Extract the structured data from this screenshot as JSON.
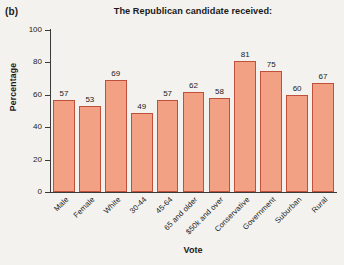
{
  "panel": {
    "label": "(b)"
  },
  "chart_data": {
    "type": "bar",
    "title": "The Republican candidate received:",
    "xlabel": "Vote",
    "ylabel": "Percentage",
    "ylim": [
      0,
      100
    ],
    "yticks": [
      0,
      20,
      40,
      60,
      80,
      100
    ],
    "grid": false,
    "legend": null,
    "bar_color": "#f2a184",
    "bar_edge_color": "#c0503a",
    "categories": [
      "Male",
      "Female",
      "White",
      "30-44",
      "45-64",
      "65 and older",
      "$50k and over",
      "Conservative",
      "Government",
      "Suburban",
      "Rural"
    ],
    "values": [
      57,
      53,
      69,
      49,
      57,
      62,
      58,
      81,
      75,
      60,
      67
    ],
    "data_labels": [
      "57",
      "53",
      "69",
      "49",
      "57",
      "62",
      "58",
      "81",
      "75",
      "60",
      "67"
    ],
    "ytick_labels": [
      "0",
      "20",
      "40",
      "60",
      "80",
      "100"
    ]
  }
}
